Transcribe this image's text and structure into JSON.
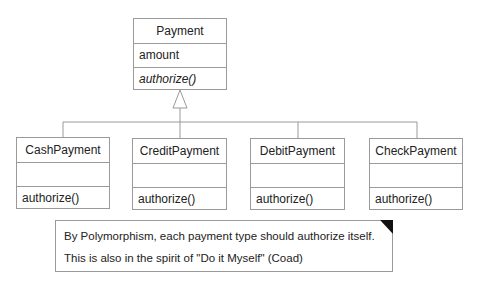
{
  "diagram": {
    "type": "UML class diagram",
    "superclass": {
      "name": "Payment",
      "attributes": [
        "amount"
      ],
      "operations": [
        "authorize()"
      ],
      "operations_italic": true
    },
    "subclasses": [
      {
        "name": "CashPayment",
        "attributes": [],
        "operations": [
          "authorize()"
        ]
      },
      {
        "name": "CreditPayment",
        "attributes": [],
        "operations": [
          "authorize()"
        ]
      },
      {
        "name": "DebitPayment",
        "attributes": [],
        "operations": [
          "authorize()"
        ]
      },
      {
        "name": "CheckPayment",
        "attributes": [],
        "operations": [
          "authorize()"
        ]
      }
    ],
    "relationship": "generalization",
    "note": {
      "line1": "By Polymorphism, each payment type should authorize itself.",
      "line2": "This is also in the spirit of \"Do it Myself\" (Coad)"
    }
  },
  "colors": {
    "border": "#9a9a9a",
    "text": "#222222",
    "note_corner": "#111111",
    "background": "#ffffff"
  }
}
